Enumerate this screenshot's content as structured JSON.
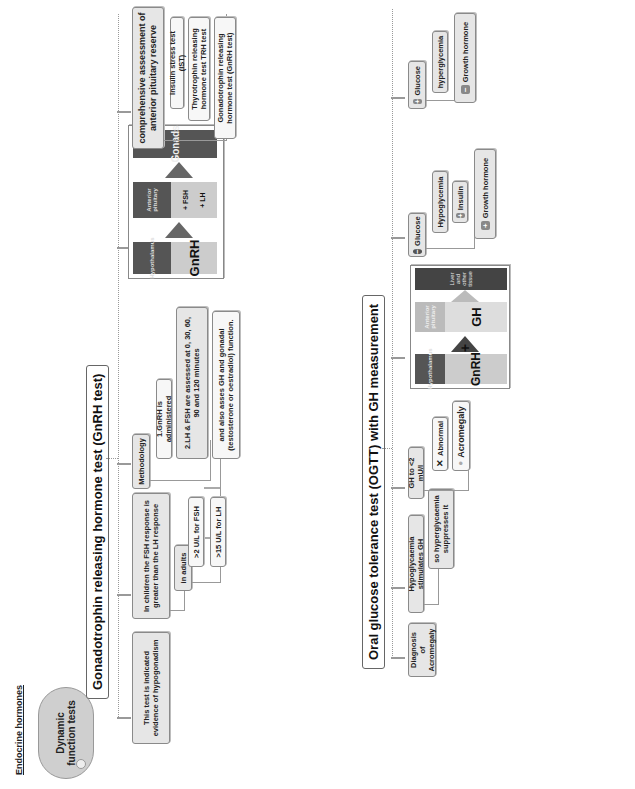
{
  "header": {
    "section_title": "Endocrine hormones"
  },
  "root": {
    "label": "Dynamic function tests"
  },
  "gnrh_test": {
    "title": "Gonadotrophin releasing hormone test (GnRH test)",
    "indication": "This test is indicated evidence of hypogonadism",
    "children_response": "In children the FSH response is greater than the LH response",
    "adults": {
      "label": "in adults",
      "items": [
        ">2 U/L for FSH",
        ">15 U/L for LH"
      ]
    },
    "methodology": {
      "label": "Methodology",
      "steps": [
        "1.GnRH is administered",
        "2.LH & FSH are assessed at 0, 30, 60, 90 and 120 minutes",
        "and also asses GH and gonadal (testosterone or oestradiol) function."
      ]
    },
    "axis_figure": {
      "top_label": "Hypothalamus",
      "top_hormone": "GnRH",
      "mid_label": "Anterior pituitary",
      "mid_hormones": [
        "+ LH",
        "+ FSH"
      ],
      "bottom_label": "Gonads"
    },
    "reserve": {
      "label": "comprehensive assessment of anterior pituitary reserve",
      "tests": [
        "Insulin stress test (IST)",
        "Thyrotrophin releasing hormone test TRH test",
        "Gonadotrophin releasing hormone test (GnRH test)"
      ]
    }
  },
  "ogtt": {
    "title": "Oral glucose tolerance test (OGTT) with GH measurement",
    "diagnosis": "Diagnosis of Acromegaly",
    "hypoglycaemia": {
      "label": "Hypoglycaemia stimulates GH",
      "sub": "so hyperglycaemia suppresses it"
    },
    "gh_threshold": {
      "label": "GH to <2 mU/l",
      "items": [
        {
          "icon": "x-icon",
          "glyph": "✕",
          "label": "Abnormal"
        },
        {
          "icon": "dot-icon",
          "glyph": "●",
          "label": "Acromegaly"
        }
      ]
    },
    "axis_figure": {
      "top_label": "Hypothalamus",
      "top_hormone": "GnRH",
      "arrow_sign": "+",
      "mid_label": "Anterior pituitary",
      "mid_hormone": "GH",
      "bottom_label": "Liver and other tissue"
    },
    "glucose_minus": {
      "label": "Glucose",
      "sign": "−",
      "items": [
        {
          "sign": "",
          "label": "Hypoglycemia"
        },
        {
          "sign": "+",
          "label": "Insulin"
        },
        {
          "sign": "+",
          "label": "Growth hormone"
        }
      ]
    },
    "glucose_plus": {
      "label": "Glucose",
      "sign": "+",
      "items": [
        {
          "sign": "",
          "label": "hyperglycemia"
        },
        {
          "sign": "−",
          "label": "Growth hormone"
        }
      ]
    }
  },
  "colors": {
    "dark_band": "#555555",
    "mid_band": "#bdbdbd",
    "arrow": "#666666",
    "node_bg": "#e6e6e6"
  }
}
